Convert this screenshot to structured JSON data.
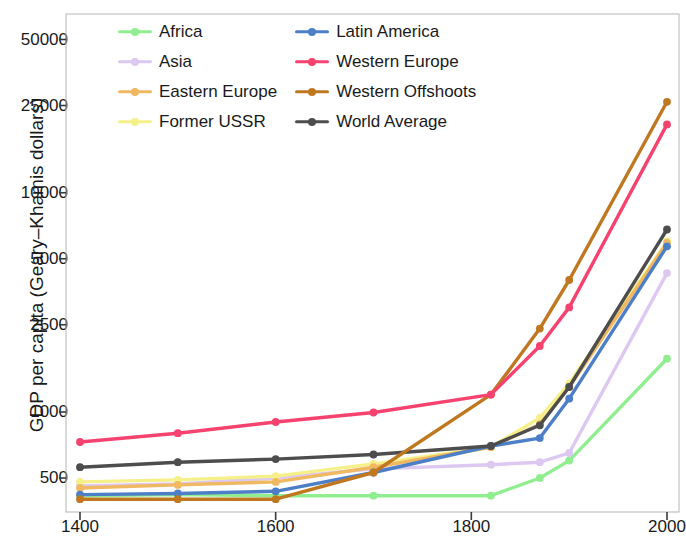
{
  "chart_data": {
    "type": "line",
    "title": "",
    "xlabel": "",
    "ylabel": "GDP per capita (Geary–Khamis dollars)",
    "yscale": "log",
    "xlim": [
      1375,
      2020
    ],
    "ylim": [
      370,
      57000
    ],
    "grid": false,
    "legend_position": "upper left",
    "xticks": [
      1400,
      1600,
      1800,
      2000
    ],
    "xtick_labels": [
      "1400",
      "1600",
      "1800",
      "2000"
    ],
    "yticks": [
      500,
      1000,
      2500,
      5000,
      10000,
      25000,
      50000
    ],
    "ytick_labels": [
      "500",
      "1000",
      "2500",
      "5000",
      "10000",
      "25000",
      "50000"
    ],
    "x": [
      1400,
      1500,
      1600,
      1700,
      1820,
      1870,
      1900,
      2000
    ],
    "series": [
      {
        "name": "Africa",
        "color": "#90ee90",
        "values": [
          415,
          420,
          415,
          415,
          415,
          500,
          600,
          1750
        ]
      },
      {
        "name": "Asia",
        "color": "#dcc8f0",
        "values": [
          460,
          470,
          500,
          550,
          575,
          590,
          650,
          4300
        ]
      },
      {
        "name": "Eastern Europe",
        "color": "#f0b860",
        "values": [
          450,
          465,
          480,
          560,
          690,
          880,
          1300,
          5900
        ]
      },
      {
        "name": "Former USSR",
        "color": "#f5f08a",
        "values": [
          480,
          490,
          510,
          580,
          690,
          940,
          1350,
          6000
        ]
      },
      {
        "name": "Latin America",
        "color": "#4d7ec8",
        "values": [
          420,
          425,
          435,
          530,
          700,
          760,
          1150,
          5700
        ]
      },
      {
        "name": "Western Europe",
        "color": "#f5426e",
        "values": [
          730,
          800,
          900,
          995,
          1200,
          2000,
          3000,
          20500
        ]
      },
      {
        "name": "Western Offshoots",
        "color": "#c07820",
        "values": [
          400,
          400,
          400,
          530,
          1200,
          2400,
          4000,
          26000
        ]
      },
      {
        "name": "World Average",
        "color": "#4d4d4d",
        "values": [
          560,
          590,
          610,
          640,
          700,
          870,
          1300,
          6800
        ]
      }
    ]
  },
  "legend": {
    "entries": [
      "Africa",
      "Latin America",
      "Asia",
      "Western Europe",
      "Eastern Europe",
      "Western Offshoots",
      "Former USSR",
      "World Average"
    ]
  }
}
